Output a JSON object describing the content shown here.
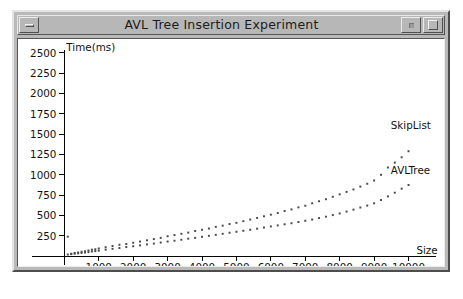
{
  "window": {
    "title": "AVL Tree Insertion Experiment",
    "minimize_label": "minimize",
    "restore_label": "restore",
    "maximize_label": "maximize"
  },
  "chart_data": {
    "type": "scatter",
    "title": "AVL Tree Insertion Experiment",
    "xlabel": "Size",
    "ylabel": "Time(ms)",
    "xlim": [
      0,
      10400
    ],
    "ylim": [
      0,
      2500
    ],
    "grid": false,
    "legend_position": "inline-right",
    "x_ticks": [
      1000,
      2000,
      3000,
      4000,
      5000,
      6000,
      7000,
      8000,
      9000,
      10000
    ],
    "y_ticks": [
      250,
      500,
      750,
      1000,
      1250,
      1500,
      1750,
      2000,
      2250,
      2500
    ],
    "x_tick_labels": [
      "1000",
      "2000",
      "3000",
      "4000",
      "5000",
      "6000",
      "7000",
      "8000",
      "9000",
      "10000"
    ],
    "y_tick_labels": [
      "250",
      "500",
      "750",
      "1000",
      "1250",
      "1500",
      "1750",
      "2000",
      "2250",
      "2500"
    ],
    "series": [
      {
        "name": "SkipList",
        "label": "SkipList",
        "color": "#4a4a4a",
        "x": [
          100,
          200,
          300,
          400,
          500,
          600,
          700,
          800,
          900,
          1000,
          1200,
          1400,
          1600,
          1800,
          2000,
          2200,
          2400,
          2600,
          2800,
          3000,
          3200,
          3400,
          3600,
          3800,
          4000,
          4200,
          4400,
          4600,
          4800,
          5000,
          5200,
          5400,
          5600,
          5800,
          6000,
          6200,
          6400,
          6600,
          6800,
          7000,
          7200,
          7400,
          7600,
          7800,
          8000,
          8200,
          8400,
          8600,
          8800,
          9000,
          9200,
          9400,
          9600,
          9800,
          10000
        ],
        "y": [
          240,
          30,
          40,
          45,
          55,
          60,
          70,
          80,
          85,
          95,
          110,
          125,
          140,
          150,
          165,
          180,
          195,
          210,
          225,
          245,
          260,
          275,
          290,
          310,
          325,
          340,
          360,
          375,
          395,
          410,
          430,
          450,
          470,
          490,
          510,
          530,
          555,
          575,
          600,
          620,
          650,
          675,
          700,
          730,
          760,
          790,
          820,
          855,
          890,
          930,
          1000,
          1090,
          1150,
          1215,
          1290
        ]
      },
      {
        "name": "AVLTree",
        "label": "AVLTree",
        "color": "#4a4a4a",
        "x": [
          100,
          200,
          300,
          400,
          500,
          600,
          700,
          800,
          900,
          1000,
          1200,
          1400,
          1600,
          1800,
          2000,
          2200,
          2400,
          2600,
          2800,
          3000,
          3200,
          3400,
          3600,
          3800,
          4000,
          4200,
          4400,
          4600,
          4800,
          5000,
          5200,
          5400,
          5600,
          5800,
          6000,
          6200,
          6400,
          6600,
          6800,
          7000,
          7200,
          7400,
          7600,
          7800,
          8000,
          8200,
          8400,
          8600,
          8800,
          9000,
          9200,
          9400,
          9600,
          9800,
          10000
        ],
        "y": [
          20,
          25,
          30,
          35,
          40,
          45,
          50,
          58,
          62,
          68,
          80,
          90,
          100,
          112,
          122,
          132,
          145,
          155,
          168,
          180,
          190,
          202,
          215,
          225,
          238,
          250,
          262,
          275,
          288,
          300,
          312,
          325,
          338,
          352,
          365,
          378,
          392,
          405,
          420,
          435,
          450,
          468,
          485,
          505,
          525,
          548,
          572,
          598,
          622,
          650,
          690,
          735,
          780,
          830,
          875
        ]
      }
    ]
  }
}
